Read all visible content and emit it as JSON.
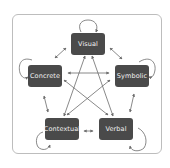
{
  "diagram": {
    "type": "graph",
    "frame": {
      "border_color": "#bdbdbd"
    },
    "node_color": "#4a4a4a",
    "text_color": "#f2f2f2",
    "edge_color": "#6b6b6b",
    "nodes": [
      {
        "id": "visual",
        "label": "Visual"
      },
      {
        "id": "concrete",
        "label": "Concrete"
      },
      {
        "id": "symbolic",
        "label": "Symbolic"
      },
      {
        "id": "contextual",
        "label": "Contextual"
      },
      {
        "id": "verbal",
        "label": "Verbal"
      }
    ],
    "edges": [
      {
        "from": "visual",
        "to": "concrete",
        "bidirectional": true
      },
      {
        "from": "visual",
        "to": "symbolic",
        "bidirectional": true
      },
      {
        "from": "concrete",
        "to": "contextual",
        "bidirectional": true
      },
      {
        "from": "symbolic",
        "to": "verbal",
        "bidirectional": true
      },
      {
        "from": "contextual",
        "to": "verbal",
        "bidirectional": true
      },
      {
        "from": "visual",
        "to": "contextual",
        "bidirectional": true
      },
      {
        "from": "visual",
        "to": "verbal",
        "bidirectional": true
      },
      {
        "from": "concrete",
        "to": "symbolic",
        "bidirectional": true
      },
      {
        "from": "concrete",
        "to": "verbal",
        "bidirectional": true
      },
      {
        "from": "symbolic",
        "to": "contextual",
        "bidirectional": true
      },
      {
        "from": "visual",
        "to": "visual",
        "self_loop": true
      },
      {
        "from": "concrete",
        "to": "concrete",
        "self_loop": true
      },
      {
        "from": "symbolic",
        "to": "symbolic",
        "self_loop": true
      },
      {
        "from": "contextual",
        "to": "contextual",
        "self_loop": true
      },
      {
        "from": "verbal",
        "to": "verbal",
        "self_loop": true
      }
    ]
  }
}
